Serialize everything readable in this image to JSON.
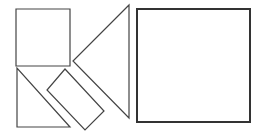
{
  "diagram": {
    "stroke_color": "#444444",
    "fill_color": "#ffffff",
    "pieces": [
      {
        "id": "small-square",
        "type": "square",
        "points": "16,9 70,9 70,66 16,66"
      },
      {
        "id": "small-triangle",
        "type": "triangle",
        "points": "17,68 17,127 70,127"
      },
      {
        "id": "rectangle",
        "type": "rectangle",
        "points": "65,69 104,111 85,130 47,90"
      },
      {
        "id": "large-triangle",
        "type": "triangle",
        "points": "129,5 73,61 129,118"
      }
    ],
    "target": {
      "id": "large-square",
      "type": "square",
      "x": 137,
      "y": 9,
      "width": 113,
      "height": 113
    }
  }
}
